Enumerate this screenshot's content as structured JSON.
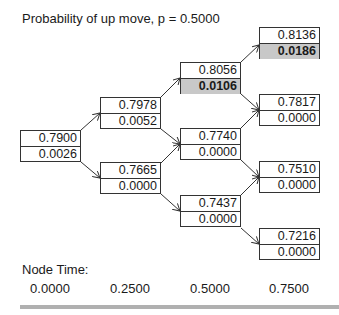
{
  "title": "Probability of up move, p = 0.5000",
  "node_time_label": "Node Time:",
  "node_times": [
    "0.0000",
    "0.2500",
    "0.5000",
    "0.7500"
  ],
  "nodes": {
    "n0": {
      "value": "0.7900",
      "option": "0.0026",
      "highlight": false
    },
    "n1u": {
      "value": "0.7978",
      "option": "0.0052",
      "highlight": false
    },
    "n1d": {
      "value": "0.7665",
      "option": "0.0000",
      "highlight": false
    },
    "n2uu": {
      "value": "0.8056",
      "option": "0.0106",
      "highlight": true
    },
    "n2ud": {
      "value": "0.7740",
      "option": "0.0000",
      "highlight": false
    },
    "n2dd": {
      "value": "0.7437",
      "option": "0.0000",
      "highlight": false
    },
    "n3uuu": {
      "value": "0.8136",
      "option": "0.0186",
      "highlight": true
    },
    "n3uud": {
      "value": "0.7817",
      "option": "0.0000",
      "highlight": false
    },
    "n3udd": {
      "value": "0.7510",
      "option": "0.0000",
      "highlight": false
    },
    "n3ddd": {
      "value": "0.7216",
      "option": "0.0000",
      "highlight": false
    }
  },
  "colors": {
    "highlight": "#c8c8c8",
    "border": "#333333",
    "bar": "#b0b0b0"
  }
}
